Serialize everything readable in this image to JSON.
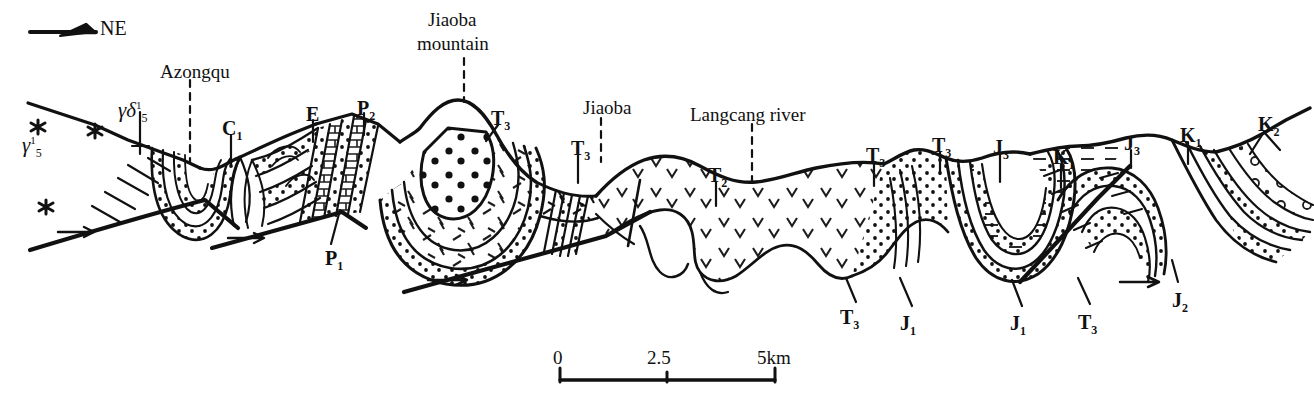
{
  "figure": {
    "kind": "geological-cross-section",
    "orientation_marker": {
      "label": "NE",
      "icon": "north-east-arrow-icon"
    },
    "line_color": "#111111",
    "background_color": "#ffffff"
  },
  "place_labels": [
    {
      "id": "azongqu",
      "text": "Azongqu",
      "x": 160,
      "y": 62,
      "leader": "dashed"
    },
    {
      "id": "jiaoba-mtn-1",
      "text": "Jiaoba",
      "x": 428,
      "y": 10,
      "leader": "dashed"
    },
    {
      "id": "jiaoba-mtn-2",
      "text": "mountain",
      "x": 417,
      "y": 34,
      "leader": "dashed"
    },
    {
      "id": "jiaoba",
      "text": "Jiaoba",
      "x": 583,
      "y": 98,
      "leader": "dashed"
    },
    {
      "id": "langcang",
      "text": "Langcang river",
      "x": 690,
      "y": 105,
      "leader": "dashed"
    }
  ],
  "unit_labels": [
    {
      "id": "u-c1",
      "base": "C",
      "sub": "1",
      "sup": "",
      "x": 222,
      "y": 118
    },
    {
      "id": "u-e",
      "base": "E",
      "sub": "",
      "sup": "",
      "x": 306,
      "y": 104
    },
    {
      "id": "u-p2",
      "base": "P",
      "sub": "2",
      "sup": "",
      "x": 357,
      "y": 98
    },
    {
      "id": "u-p1",
      "base": "P",
      "sub": "1",
      "sup": "",
      "x": 325,
      "y": 248
    },
    {
      "id": "u-t3a",
      "base": "T",
      "sub": "3",
      "sup": "",
      "x": 491,
      "y": 108
    },
    {
      "id": "u-t3b",
      "base": "T",
      "sub": "3",
      "sup": "",
      "x": 571,
      "y": 138
    },
    {
      "id": "u-t2",
      "base": "T",
      "sub": "2",
      "sup": "",
      "x": 708,
      "y": 165
    },
    {
      "id": "u-t3c",
      "base": "T",
      "sub": "3",
      "sup": "",
      "x": 866,
      "y": 145
    },
    {
      "id": "u-t3d",
      "base": "T",
      "sub": "3",
      "sup": "",
      "x": 932,
      "y": 135
    },
    {
      "id": "u-j3a",
      "base": "J",
      "sub": "3",
      "sup": "",
      "x": 993,
      "y": 137
    },
    {
      "id": "u-k1a",
      "base": "K",
      "sub": "1",
      "sup": "",
      "x": 1053,
      "y": 147
    },
    {
      "id": "u-j3b",
      "base": "J",
      "sub": "3",
      "sup": "",
      "x": 1124,
      "y": 133
    },
    {
      "id": "u-k1b",
      "base": "K",
      "sub": "1",
      "sup": "",
      "x": 1180,
      "y": 125
    },
    {
      "id": "u-k2",
      "base": "K",
      "sub": "2",
      "sup": "",
      "x": 1258,
      "y": 114
    },
    {
      "id": "u-t3e",
      "base": "T",
      "sub": "3",
      "sup": "",
      "x": 840,
      "y": 307
    },
    {
      "id": "u-j1a",
      "base": "J",
      "sub": "1",
      "sup": "",
      "x": 900,
      "y": 313
    },
    {
      "id": "u-j1b",
      "base": "J",
      "sub": "1",
      "sup": "",
      "x": 1010,
      "y": 313
    },
    {
      "id": "u-t3f",
      "base": "T",
      "sub": "3",
      "sup": "",
      "x": 1078,
      "y": 312
    },
    {
      "id": "u-j2",
      "base": "J",
      "sub": "2",
      "sup": "",
      "x": 1172,
      "y": 290
    }
  ],
  "intrusive_labels": [
    {
      "id": "gd5",
      "gamma": "γ",
      "delta": "δ",
      "sub": "5",
      "sup": "1",
      "x": 118,
      "y": 100
    },
    {
      "id": "g5",
      "gamma": "γ",
      "delta": "",
      "sub": "5",
      "sup": "1",
      "x": 22,
      "y": 135
    }
  ],
  "scale_bar": {
    "ticks": [
      "0",
      "2.5",
      "5km"
    ],
    "x_start": 560,
    "x_end": 775,
    "y": 375,
    "label_y": 352
  }
}
